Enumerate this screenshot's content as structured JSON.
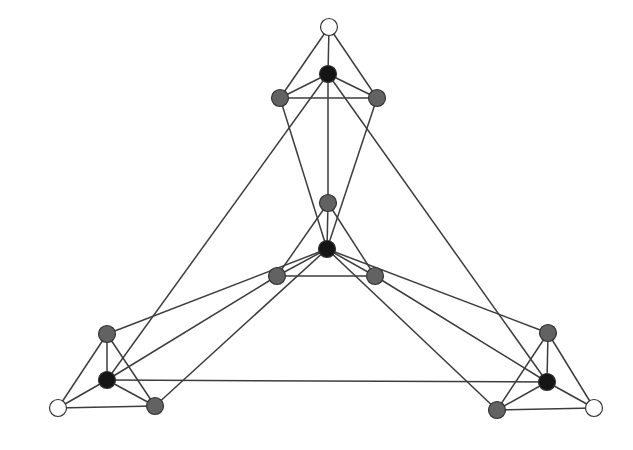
{
  "diagram": {
    "type": "graph",
    "width": 633,
    "height": 450,
    "colors": {
      "background": "#ffffff",
      "edge": "#3d3d3d",
      "node_white_fill": "#ffffff",
      "node_gray_fill": "#626262",
      "node_black_fill": "#151515",
      "node_stroke": "#333333"
    },
    "node_radius": 8.5,
    "nodes": [
      {
        "id": "top-white",
        "x": 329,
        "y": 27,
        "kind": "white"
      },
      {
        "id": "top-black",
        "x": 328,
        "y": 74,
        "kind": "black"
      },
      {
        "id": "top-gray-left",
        "x": 280,
        "y": 98,
        "kind": "gray"
      },
      {
        "id": "top-gray-right",
        "x": 377,
        "y": 98,
        "kind": "gray"
      },
      {
        "id": "center-gray-top",
        "x": 328,
        "y": 203,
        "kind": "gray"
      },
      {
        "id": "center-black",
        "x": 327,
        "y": 249,
        "kind": "black"
      },
      {
        "id": "center-gray-left",
        "x": 277,
        "y": 276,
        "kind": "gray"
      },
      {
        "id": "center-gray-right",
        "x": 375,
        "y": 276,
        "kind": "gray"
      },
      {
        "id": "bl-gray-top",
        "x": 107,
        "y": 334,
        "kind": "gray"
      },
      {
        "id": "bl-black",
        "x": 107,
        "y": 380,
        "kind": "black"
      },
      {
        "id": "bl-white",
        "x": 58,
        "y": 408,
        "kind": "white"
      },
      {
        "id": "bl-gray-right",
        "x": 155,
        "y": 406,
        "kind": "gray"
      },
      {
        "id": "br-gray-top",
        "x": 548,
        "y": 333,
        "kind": "gray"
      },
      {
        "id": "br-black",
        "x": 547,
        "y": 382,
        "kind": "black"
      },
      {
        "id": "br-gray-left",
        "x": 497,
        "y": 410,
        "kind": "gray"
      },
      {
        "id": "br-white",
        "x": 594,
        "y": 408,
        "kind": "white"
      }
    ],
    "edges": [
      [
        "top-white",
        "top-black"
      ],
      [
        "top-white",
        "top-gray-left"
      ],
      [
        "top-white",
        "top-gray-right"
      ],
      [
        "top-black",
        "top-gray-left"
      ],
      [
        "top-black",
        "top-gray-right"
      ],
      [
        "top-gray-left",
        "top-gray-right"
      ],
      [
        "top-black",
        "center-gray-top"
      ],
      [
        "top-black",
        "bl-black"
      ],
      [
        "top-black",
        "br-black"
      ],
      [
        "top-gray-left",
        "center-black"
      ],
      [
        "top-gray-right",
        "center-black"
      ],
      [
        "center-gray-top",
        "center-black"
      ],
      [
        "center-gray-top",
        "center-gray-left"
      ],
      [
        "center-gray-top",
        "center-gray-right"
      ],
      [
        "center-black",
        "center-gray-left"
      ],
      [
        "center-black",
        "center-gray-right"
      ],
      [
        "center-gray-left",
        "center-gray-right"
      ],
      [
        "center-black",
        "bl-gray-top"
      ],
      [
        "center-black",
        "bl-gray-right"
      ],
      [
        "center-gray-left",
        "bl-black"
      ],
      [
        "center-black",
        "br-gray-top"
      ],
      [
        "center-black",
        "br-gray-left"
      ],
      [
        "center-gray-right",
        "br-black"
      ],
      [
        "bl-white",
        "bl-gray-top"
      ],
      [
        "bl-white",
        "bl-black"
      ],
      [
        "bl-white",
        "bl-gray-right"
      ],
      [
        "bl-black",
        "bl-gray-top"
      ],
      [
        "bl-black",
        "bl-gray-right"
      ],
      [
        "bl-gray-top",
        "bl-gray-right"
      ],
      [
        "br-white",
        "br-gray-top"
      ],
      [
        "br-white",
        "br-black"
      ],
      [
        "br-white",
        "br-gray-left"
      ],
      [
        "br-black",
        "br-gray-top"
      ],
      [
        "br-black",
        "br-gray-left"
      ],
      [
        "br-gray-top",
        "br-gray-left"
      ],
      [
        "bl-black",
        "br-black"
      ]
    ]
  }
}
